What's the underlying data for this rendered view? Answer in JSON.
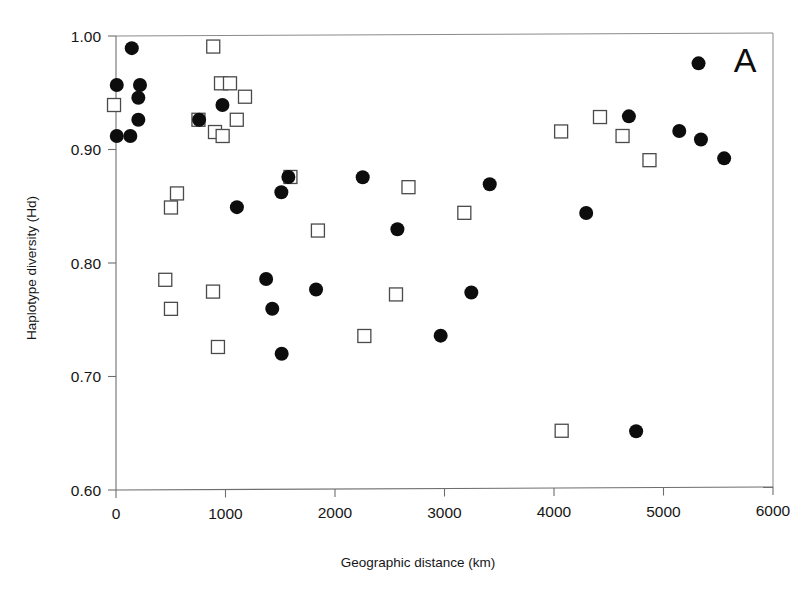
{
  "figure": {
    "panel_label": "A",
    "background_color": "#ffffff",
    "marker_filled_color": "#0d0d0d",
    "marker_open_color": "#ffffff",
    "marker_open_stroke": "#4a4a4a",
    "axis_color": "#6e6e6e"
  },
  "chart_data": {
    "type": "scatter",
    "title": "A",
    "xlabel": "Geographic distance (km)",
    "ylabel": "Haplotype diversity (Hd)",
    "xlim": [
      0,
      6000
    ],
    "ylim": [
      0.6,
      1.0
    ],
    "xticks": [
      0,
      1000,
      2000,
      3000,
      4000,
      5000,
      6000
    ],
    "yticks": [
      0.6,
      0.7,
      0.8,
      0.9,
      1.0
    ],
    "xtick_labels": [
      "0",
      "1000",
      "2000",
      "3000",
      "4000",
      "5000",
      "6000"
    ],
    "ytick_labels": [
      "0.60",
      "0.70",
      "0.80",
      "0.90",
      "1.00"
    ],
    "grid": false,
    "legend": null,
    "series": [
      {
        "name": "filled-circles",
        "marker": "filled-circle",
        "color": "#0d0d0d",
        "points": [
          {
            "x": 144,
            "y": 0.9893
          },
          {
            "x": 7,
            "y": 0.9568
          },
          {
            "x": 219,
            "y": 0.9568
          },
          {
            "x": 204,
            "y": 0.9456
          },
          {
            "x": 204,
            "y": 0.9262
          },
          {
            "x": 7,
            "y": 0.9119
          },
          {
            "x": 131,
            "y": 0.9119
          },
          {
            "x": 972,
            "y": 0.9392
          },
          {
            "x": 759,
            "y": 0.9262
          },
          {
            "x": 1574,
            "y": 0.8758
          },
          {
            "x": 1510,
            "y": 0.8623
          },
          {
            "x": 2253,
            "y": 0.8756
          },
          {
            "x": 3413,
            "y": 0.8694
          },
          {
            "x": 4294,
            "y": 0.844
          },
          {
            "x": 1104,
            "y": 0.8492
          },
          {
            "x": 2570,
            "y": 0.8298
          },
          {
            "x": 1371,
            "y": 0.7859
          },
          {
            "x": 1427,
            "y": 0.7597
          },
          {
            "x": 1827,
            "y": 0.7766
          },
          {
            "x": 3245,
            "y": 0.774
          },
          {
            "x": 1513,
            "y": 0.72
          },
          {
            "x": 2965,
            "y": 0.736
          },
          {
            "x": 4750,
            "y": 0.6518
          },
          {
            "x": 5320,
            "y": 0.9759
          },
          {
            "x": 4684,
            "y": 0.9292
          },
          {
            "x": 5144,
            "y": 0.9163
          },
          {
            "x": 5342,
            "y": 0.9088
          },
          {
            "x": 5554,
            "y": 0.8922
          }
        ]
      },
      {
        "name": "open-squares",
        "marker": "open-square",
        "color": "#ffffff",
        "points": [
          {
            "x": -18,
            "y": 0.9392
          },
          {
            "x": 888,
            "y": 0.9907
          },
          {
            "x": 959,
            "y": 0.9583
          },
          {
            "x": 1041,
            "y": 0.9583
          },
          {
            "x": 1178,
            "y": 0.9465
          },
          {
            "x": 753,
            "y": 0.9262
          },
          {
            "x": 1103,
            "y": 0.9262
          },
          {
            "x": 904,
            "y": 0.9154
          },
          {
            "x": 974,
            "y": 0.9119
          },
          {
            "x": 1593,
            "y": 0.8758
          },
          {
            "x": 2671,
            "y": 0.8668
          },
          {
            "x": 3181,
            "y": 0.8442
          },
          {
            "x": 4420,
            "y": 0.9286
          },
          {
            "x": 4065,
            "y": 0.9159
          },
          {
            "x": 4626,
            "y": 0.9119
          },
          {
            "x": 4872,
            "y": 0.8906
          },
          {
            "x": 502,
            "y": 0.8489
          },
          {
            "x": 557,
            "y": 0.8613
          },
          {
            "x": 1844,
            "y": 0.8286
          },
          {
            "x": 450,
            "y": 0.7852
          },
          {
            "x": 502,
            "y": 0.7596
          },
          {
            "x": 886,
            "y": 0.7748
          },
          {
            "x": 2557,
            "y": 0.7723
          },
          {
            "x": 931,
            "y": 0.726
          },
          {
            "x": 2268,
            "y": 0.7357
          },
          {
            "x": 4070,
            "y": 0.6522
          }
        ]
      }
    ]
  }
}
